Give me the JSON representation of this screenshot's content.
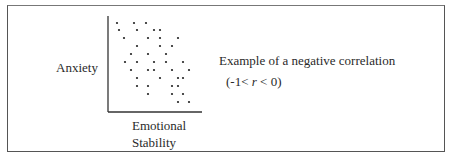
{
  "chart_data": {
    "type": "scatter",
    "title": "",
    "xlabel": "Emotional Stability",
    "ylabel": "Anxiety",
    "annotation": "Example of a negative correlation",
    "range_note": "(-1< r < 0)",
    "grid": false,
    "legend": null,
    "points_px": [
      [
        117,
        23
      ],
      [
        134,
        23
      ],
      [
        146,
        23
      ],
      [
        119,
        30
      ],
      [
        137,
        30
      ],
      [
        154,
        30
      ],
      [
        160,
        30
      ],
      [
        124,
        38
      ],
      [
        148,
        38
      ],
      [
        160,
        38
      ],
      [
        178,
        38
      ],
      [
        137,
        46
      ],
      [
        160,
        46
      ],
      [
        172,
        46
      ],
      [
        131,
        54
      ],
      [
        148,
        54
      ],
      [
        166,
        54
      ],
      [
        125,
        62
      ],
      [
        137,
        62
      ],
      [
        154,
        62
      ],
      [
        166,
        62
      ],
      [
        183,
        62
      ],
      [
        131,
        70
      ],
      [
        148,
        70
      ],
      [
        154,
        70
      ],
      [
        172,
        70
      ],
      [
        189,
        70
      ],
      [
        137,
        78
      ],
      [
        160,
        78
      ],
      [
        178,
        78
      ],
      [
        183,
        78
      ],
      [
        137,
        86
      ],
      [
        148,
        86
      ],
      [
        172,
        86
      ],
      [
        178,
        86
      ],
      [
        148,
        94
      ],
      [
        172,
        94
      ],
      [
        183,
        94
      ],
      [
        178,
        102
      ],
      [
        189,
        102
      ]
    ]
  },
  "labels": {
    "y_axis": "Anxiety",
    "x_axis_line1": "Emotional",
    "x_axis_line2": "Stability",
    "caption": "Example of a negative correlation",
    "range": "(-1< r < 0)"
  }
}
